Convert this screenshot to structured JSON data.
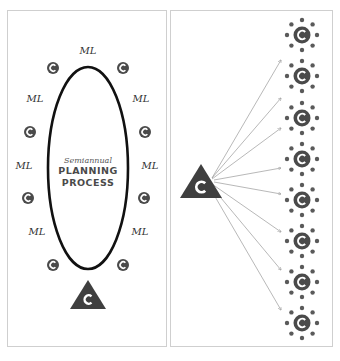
{
  "colors": {
    "icon_fill": "#4a4a4a",
    "icon_glyph": "#ffffff",
    "ellipse_stroke": "#111111",
    "arrow_stroke": "#9a9a9a",
    "panel_border": "#cfcfcf"
  },
  "left_panel": {
    "center_label": {
      "subtitle": "Semiannual",
      "line1": "PLANNING",
      "line2": "PROCESS"
    },
    "ml_labels": [
      {
        "text": "ML",
        "position": "top"
      },
      {
        "text": "ML",
        "position": "left-1"
      },
      {
        "text": "ML",
        "position": "right-1"
      },
      {
        "text": "ML",
        "position": "left-2"
      },
      {
        "text": "ML",
        "position": "right-2"
      },
      {
        "text": "ML",
        "position": "left-3"
      },
      {
        "text": "ML",
        "position": "right-3"
      }
    ],
    "circle_icon_glyph": "C",
    "circle_icon_count": 8,
    "triangle_icon_glyph": "C"
  },
  "right_panel": {
    "triangle_icon_glyph": "C",
    "arrow_count": 8,
    "cluster_count": 8,
    "cluster_icon_glyph": "C",
    "satellite_dots_per_cluster": 8
  }
}
